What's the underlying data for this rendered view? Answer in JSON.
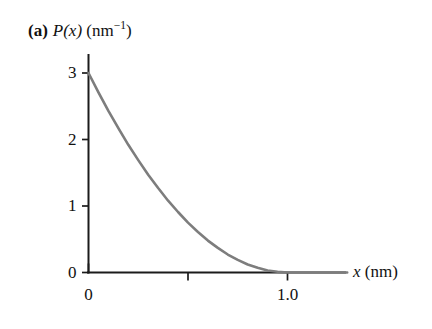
{
  "figure": {
    "panel_letter": "(a)",
    "yaxis_title_main": "P(x)",
    "yaxis_title_unit_open": "(nm",
    "yaxis_title_unit_exp": "−1",
    "yaxis_title_unit_close": ")",
    "xaxis_title_symbol": "x",
    "xaxis_title_unit": "(nm)",
    "curve_color": "#7d7d7d",
    "axis_color": "#1b1b1b",
    "background_color": "#ffffff"
  },
  "chart_data": {
    "type": "line",
    "xlabel": "x (nm)",
    "ylabel": "P(x) (nm−1)",
    "xlim": [
      0,
      1.3
    ],
    "ylim": [
      0,
      3.2
    ],
    "grid": false,
    "legend": null,
    "x_ticks": [
      0,
      0.5,
      1.0
    ],
    "x_tick_labels": [
      "0",
      "",
      "1.0"
    ],
    "y_ticks": [
      0,
      1,
      2,
      3
    ],
    "y_tick_labels": [
      "0",
      "1",
      "2",
      "3"
    ],
    "series": [
      {
        "name": "P(x)",
        "color": "#7d7d7d",
        "x": [
          0.0,
          0.05,
          0.1,
          0.15,
          0.2,
          0.25,
          0.3,
          0.35,
          0.4,
          0.45,
          0.5,
          0.55,
          0.6,
          0.65,
          0.7,
          0.75,
          0.8,
          0.85,
          0.9,
          0.95,
          1.0,
          1.05,
          1.1,
          1.15,
          1.2,
          1.25,
          1.3
        ],
        "y": [
          3.0,
          2.71,
          2.43,
          2.17,
          1.92,
          1.69,
          1.47,
          1.27,
          1.08,
          0.91,
          0.75,
          0.61,
          0.48,
          0.37,
          0.27,
          0.19,
          0.12,
          0.07,
          0.03,
          0.01,
          0.0,
          0.0,
          0.0,
          0.0,
          0.0,
          0.0,
          0.0
        ]
      }
    ],
    "annotations": []
  }
}
